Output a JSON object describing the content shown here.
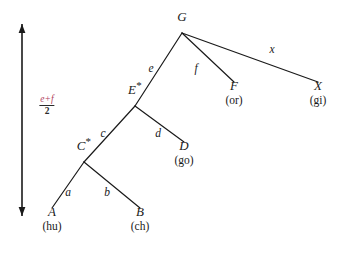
{
  "figure": {
    "kind": "derivation-tree",
    "background_color": "#ffffff",
    "ink_color": "#1a1a1a",
    "accent_color": "#b0415c"
  },
  "axis": {
    "name": "time-axis",
    "orientation": "vertical-double-arrow",
    "x": 22,
    "y_top": 24,
    "y_bottom": 216,
    "label": {
      "numerator": "e+f",
      "denominator": "2",
      "x": 47,
      "y": 105
    }
  },
  "tree": {
    "nodes": [
      {
        "id": "G",
        "name": "G",
        "star": "",
        "gloss": "",
        "x": 182,
        "y": 21,
        "branch_x": 182,
        "branch_y": 33
      },
      {
        "id": "E",
        "name": "E",
        "star": "*",
        "gloss": "",
        "x": 135,
        "y": 94,
        "branch_x": 135,
        "branch_y": 106
      },
      {
        "id": "F",
        "name": "F",
        "star": "",
        "gloss": "(or)",
        "x": 234,
        "y": 90,
        "branch_x": 234,
        "branch_y": 82
      },
      {
        "id": "X",
        "name": "X",
        "star": "",
        "gloss": "(gi)",
        "x": 318,
        "y": 90,
        "branch_x": 318,
        "branch_y": 82
      },
      {
        "id": "C",
        "name": "C",
        "star": "*",
        "gloss": "",
        "x": 84,
        "y": 150,
        "branch_x": 84,
        "branch_y": 162
      },
      {
        "id": "D",
        "name": "D",
        "star": "",
        "gloss": "(go)",
        "x": 184,
        "y": 150,
        "branch_x": 184,
        "branch_y": 142
      },
      {
        "id": "A",
        "name": "A",
        "star": "",
        "gloss": "(hu)",
        "x": 52,
        "y": 216,
        "branch_x": 52,
        "branch_y": 208
      },
      {
        "id": "B",
        "name": "B",
        "star": "",
        "gloss": "(ch)",
        "x": 140,
        "y": 216,
        "branch_x": 140,
        "branch_y": 208
      }
    ],
    "edges": [
      {
        "id": "e",
        "from": "G",
        "to": "E",
        "label": "e",
        "label_x": 151,
        "label_y": 69
      },
      {
        "id": "f",
        "from": "G",
        "to": "F",
        "label": "f",
        "label_x": 196,
        "label_y": 69
      },
      {
        "id": "x",
        "from": "G",
        "to": "X",
        "label": "x",
        "label_x": 272,
        "label_y": 50
      },
      {
        "id": "c",
        "from": "E",
        "to": "C",
        "label": "c",
        "label_x": 103,
        "label_y": 134
      },
      {
        "id": "d",
        "from": "E",
        "to": "D",
        "label": "d",
        "label_x": 158,
        "label_y": 134
      },
      {
        "id": "a",
        "from": "C",
        "to": "A",
        "label": "a",
        "label_x": 68,
        "label_y": 193
      },
      {
        "id": "b",
        "from": "C",
        "to": "B",
        "label": "b",
        "label_x": 107,
        "label_y": 193
      }
    ]
  }
}
